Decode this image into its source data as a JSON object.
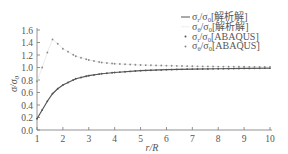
{
  "chart_data": {
    "type": "line",
    "title": "",
    "xlabel": "r/R",
    "ylabel": "σ/σ0",
    "xlim": [
      1,
      10
    ],
    "ylim": [
      0.0,
      1.6
    ],
    "xticks": [
      "1",
      "2",
      "3",
      "4",
      "5",
      "6",
      "7",
      "8",
      "9",
      "10"
    ],
    "yticks": [
      "0.0",
      "0.2",
      "0.4",
      "0.6",
      "0.8",
      "1.0",
      "1.2",
      "1.4",
      "1.6"
    ],
    "grid": false,
    "legend_position": "upper right",
    "series": [
      {
        "name": "σr/σ0[解析解]",
        "style": "solid-line",
        "color": "#555555",
        "x": [
          1.0,
          1.2,
          1.4,
          1.6,
          1.8,
          2.0,
          2.5,
          3.0,
          3.5,
          4.0,
          5.0,
          6.0,
          7.0,
          8.0,
          9.0,
          10.0
        ],
        "values": [
          0.18,
          0.32,
          0.46,
          0.58,
          0.66,
          0.72,
          0.82,
          0.87,
          0.9,
          0.92,
          0.95,
          0.965,
          0.975,
          0.98,
          0.985,
          0.99
        ]
      },
      {
        "name": "σθ/σ0[解析解]",
        "style": "thin-line",
        "color": "#dddddd",
        "x": [
          1.0,
          1.2,
          1.4,
          1.6,
          1.8,
          2.0,
          2.5,
          3.0,
          3.5,
          4.0,
          5.0,
          6.0,
          7.0,
          8.0,
          9.0,
          10.0
        ],
        "values": [
          0.78,
          1.0,
          1.24,
          1.45,
          1.38,
          1.3,
          1.18,
          1.12,
          1.08,
          1.06,
          1.04,
          1.03,
          1.02,
          1.015,
          1.012,
          1.01
        ]
      },
      {
        "name": "σr/σ0[ABAQUS]",
        "style": "dot-marker",
        "color": "#555555",
        "x": [
          1.0,
          1.2,
          1.4,
          1.6,
          1.8,
          2.0,
          2.5,
          3.0,
          3.5,
          4.0,
          5.0,
          6.0,
          7.0,
          8.0,
          9.0,
          10.0
        ],
        "values": [
          0.18,
          0.32,
          0.46,
          0.58,
          0.66,
          0.72,
          0.82,
          0.87,
          0.9,
          0.92,
          0.95,
          0.965,
          0.975,
          0.98,
          0.985,
          0.99
        ]
      },
      {
        "name": "σθ/σ0[ABAQUS]",
        "style": "dot-marker",
        "color": "#888888",
        "x": [
          1.0,
          1.2,
          1.4,
          1.6,
          1.8,
          2.0,
          2.5,
          3.0,
          3.5,
          4.0,
          5.0,
          6.0,
          7.0,
          8.0,
          9.0,
          10.0
        ],
        "values": [
          0.78,
          1.0,
          1.24,
          1.45,
          1.38,
          1.3,
          1.18,
          1.12,
          1.08,
          1.06,
          1.04,
          1.03,
          1.02,
          1.015,
          1.012,
          1.01
        ]
      }
    ]
  },
  "legend": {
    "items": [
      {
        "sym": "σ",
        "sub1": "r",
        "mid": "/σ",
        "sub2": "0",
        "suffix": "[解析解]"
      },
      {
        "sym": "σ",
        "sub1": "θ",
        "mid": "/σ",
        "sub2": "0",
        "suffix": "[解析解]"
      },
      {
        "sym": "σ",
        "sub1": "r",
        "mid": "/σ",
        "sub2": "0",
        "suffix": "[ABAQUS]"
      },
      {
        "sym": "σ",
        "sub1": "θ",
        "mid": "/σ",
        "sub2": "0",
        "suffix": "[ABAQUS]"
      }
    ]
  },
  "axis": {
    "ylabel_main": "σ/σ",
    "ylabel_sub": "0",
    "xlabel": "r/R"
  }
}
